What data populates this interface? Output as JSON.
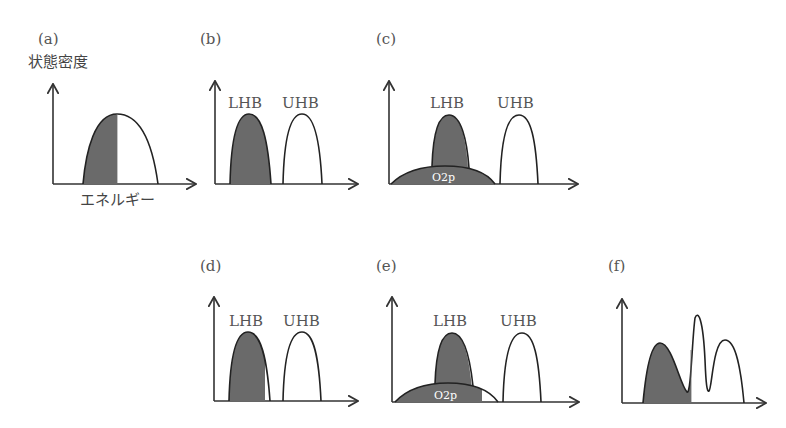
{
  "figure": {
    "y_axis_label": "状態密度",
    "x_axis_label": "エネルギー",
    "fill_color": "#6a6a6a",
    "line_color": "#222222",
    "panels": [
      {
        "id": "a",
        "label": "(a)",
        "bands": []
      },
      {
        "id": "b",
        "label": "(b)",
        "bands": [
          {
            "name": "LHB",
            "filled": "full"
          },
          {
            "name": "UHB",
            "filled": "none"
          }
        ]
      },
      {
        "id": "c",
        "label": "(c)",
        "bands": [
          {
            "name": "LHB",
            "filled": "full"
          },
          {
            "name": "UHB",
            "filled": "none"
          },
          {
            "name": "O2p",
            "filled": "full"
          }
        ]
      },
      {
        "id": "d",
        "label": "(d)",
        "bands": [
          {
            "name": "LHB",
            "filled": "partial"
          },
          {
            "name": "UHB",
            "filled": "none"
          }
        ]
      },
      {
        "id": "e",
        "label": "(e)",
        "bands": [
          {
            "name": "LHB",
            "filled": "full"
          },
          {
            "name": "UHB",
            "filled": "none"
          },
          {
            "name": "O2p",
            "filled": "partial"
          }
        ]
      },
      {
        "id": "f",
        "label": "(f)",
        "bands": []
      }
    ]
  },
  "labels": {
    "a": "(a)",
    "b": "(b)",
    "c": "(c)",
    "d": "(d)",
    "e": "(e)",
    "f": "(f)",
    "lhb": "LHB",
    "uhb": "UHB",
    "o2p": "O2p",
    "dos": "状態密度",
    "energy": "エネルギー"
  }
}
